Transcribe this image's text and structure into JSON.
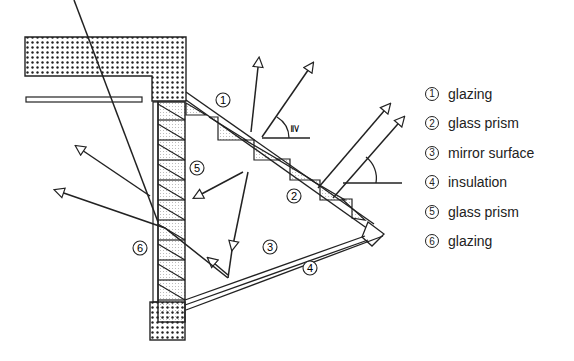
{
  "diagram": {
    "type": "cross-section",
    "callouts": [
      {
        "id": "1",
        "label": "glazing"
      },
      {
        "id": "2",
        "label": "glass prism"
      },
      {
        "id": "3",
        "label": "mirror surface"
      },
      {
        "id": "4",
        "label": "insulation"
      },
      {
        "id": "5",
        "label": "glass prism"
      },
      {
        "id": "6",
        "label": "glazing"
      }
    ],
    "angle_symbol": "≧"
  },
  "legend": {
    "items": [
      {
        "num": "1",
        "label": "glazing"
      },
      {
        "num": "2",
        "label": "glass prism"
      },
      {
        "num": "3",
        "label": "mirror surface"
      },
      {
        "num": "4",
        "label": "insulation"
      },
      {
        "num": "5",
        "label": "glass prism"
      },
      {
        "num": "6",
        "label": "glazing"
      }
    ]
  }
}
